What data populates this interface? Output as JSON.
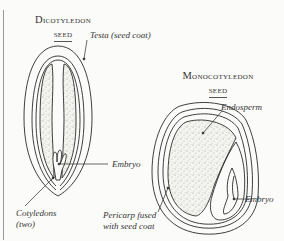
{
  "diagram": {
    "dicot": {
      "title": "Dicotyledon",
      "subtitle": "seed",
      "labels": {
        "testa": "Testa (seed coat)",
        "embryo": "Embryo",
        "cotyledons_line1": "Cotyledons",
        "cotyledons_line2": "(two)"
      }
    },
    "monocot": {
      "title": "Monocotyledon",
      "subtitle": "seed",
      "labels": {
        "endosperm": "Endosperm",
        "pericarp_line1": "Pericarp fused",
        "pericarp_line2": "with seed coat",
        "embryo": "Embryo"
      }
    },
    "colors": {
      "background": "#fbfbf9",
      "line": "#2a2a2a",
      "stipple": "#555555"
    }
  }
}
